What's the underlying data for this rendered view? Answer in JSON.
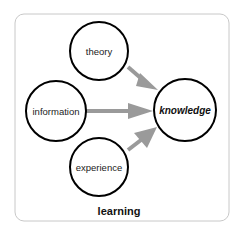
{
  "diagram": {
    "title": "learning",
    "nodes": [
      {
        "id": "theory",
        "label": "theory"
      },
      {
        "id": "information",
        "label": "information"
      },
      {
        "id": "experience",
        "label": "experience"
      },
      {
        "id": "knowledge",
        "label": "knowledge"
      }
    ],
    "edges": [
      {
        "from": "theory",
        "to": "knowledge"
      },
      {
        "from": "information",
        "to": "knowledge"
      },
      {
        "from": "experience",
        "to": "knowledge"
      }
    ],
    "colors": {
      "circle_stroke": "#000000",
      "arrow": "#9a9a9a",
      "frame": "#c8c8c8"
    }
  }
}
